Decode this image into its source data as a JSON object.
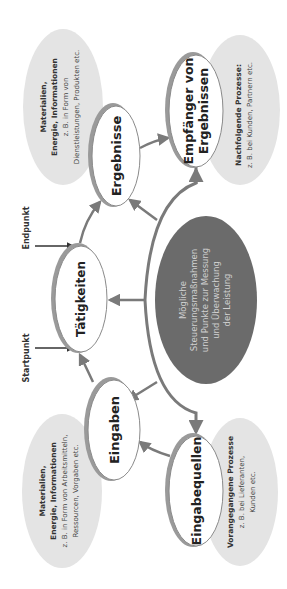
{
  "diagram": {
    "orientation": "rotated-90-ccw",
    "colors": {
      "arrow": "#7a7a7a",
      "ellipse_border": "#8a8a8a",
      "ellipse_shadow": "#9a9a9a",
      "grey_bubble": "#e4e4e4",
      "center_fill": "#6b6b6b",
      "center_text": "#d0d0d0"
    },
    "nodes": {
      "eingabequellen": {
        "label": "Eingabequellen"
      },
      "eingaben": {
        "label": "Eingaben"
      },
      "taetigkeiten": {
        "label": "Tätigkeiten"
      },
      "ergebnisse": {
        "label": "Ergebnisse"
      },
      "empfaenger": {
        "line1": "Empfänger von",
        "line2": "Ergebnissen"
      },
      "center": {
        "line1": "Mögliche",
        "line2": "Steuerungsmaßnahmen",
        "line3": "und Punkte zur Messung",
        "line4": "und Überwachung",
        "line5": "der Leistung"
      }
    },
    "bubbles": {
      "inputs_materials": {
        "title1": "Materialien,",
        "title2": "Energie, Informationen",
        "text1": "z. B. in Form von Arbeitsmitteln,",
        "text2": "Ressourcen, Vorgaben etc."
      },
      "outputs_materials": {
        "title1": "Materialien,",
        "title2": "Energie, Informationen",
        "text1": "z. B. in Form von",
        "text2": "Dienstleistungen, Produkten etc."
      },
      "previous_processes": {
        "title": "Vorangegangene Prozesse",
        "text1": "z. B. bei Lieferanten,",
        "text2": "Kunden etc."
      },
      "following_processes": {
        "title": "Nachfolgende Prozesse:",
        "text1": "z. B. bei Kunden, Partnern etc."
      }
    },
    "markers": {
      "start": "Startpunkt",
      "end": "Endpunkt"
    }
  }
}
